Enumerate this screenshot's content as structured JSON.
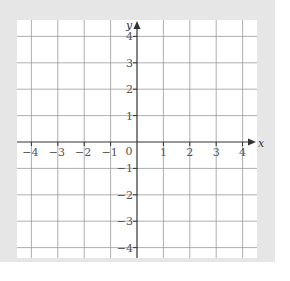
{
  "chart_data": {
    "type": "coordinate-grid",
    "title": "",
    "xlabel": "x",
    "ylabel": "y",
    "xlim": [
      -4.5,
      4.5
    ],
    "ylim": [
      -4.5,
      4.5
    ],
    "grid": true,
    "origin_label": "0",
    "x_ticks": [
      -4,
      -3,
      -2,
      -1,
      1,
      2,
      3,
      4
    ],
    "x_tick_labels": [
      "−4",
      "−3",
      "−2",
      "−1",
      "1",
      "2",
      "3",
      "4"
    ],
    "y_ticks": [
      4,
      3,
      2,
      1,
      -1,
      -2,
      -3,
      -4
    ],
    "y_tick_labels": [
      "4",
      "3",
      "2",
      "1",
      "−1",
      "−2",
      "−3",
      "−4"
    ],
    "series": []
  },
  "colors": {
    "background": "#e6e6e6",
    "panel": "#ffffff",
    "grid": "#999999",
    "axis": "#333333",
    "label": "#555555"
  },
  "layout": {
    "origin_px": [
      137,
      142
    ],
    "unit_px": 26.4
  }
}
